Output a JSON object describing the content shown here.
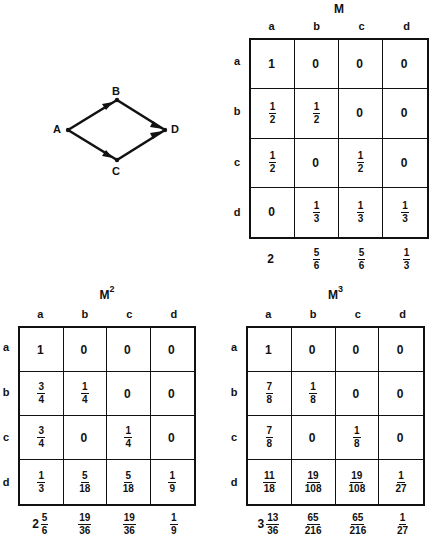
{
  "graph": {
    "nodes": [
      {
        "id": "A",
        "label": "A"
      },
      {
        "id": "B",
        "label": "B"
      },
      {
        "id": "C",
        "label": "C"
      },
      {
        "id": "D",
        "label": "D"
      }
    ],
    "edges": [
      {
        "from": "A",
        "to": "B"
      },
      {
        "from": "A",
        "to": "C"
      },
      {
        "from": "B",
        "to": "D"
      },
      {
        "from": "C",
        "to": "D"
      }
    ]
  },
  "matrices": {
    "M": {
      "title": "M",
      "power": "",
      "col_headers": [
        "a",
        "b",
        "c",
        "d"
      ],
      "row_headers": [
        "a",
        "b",
        "c",
        "d"
      ],
      "rows": [
        [
          "1",
          "0",
          "0",
          "0"
        ],
        [
          "1/2",
          "1/2",
          "0",
          "0"
        ],
        [
          "1/2",
          "0",
          "1/2",
          "0"
        ],
        [
          "0",
          "1/3",
          "1/3",
          "1/3"
        ]
      ],
      "column_sums": [
        "2",
        "5/6",
        "5/6",
        "1/3"
      ]
    },
    "M2": {
      "title": "M",
      "power": "2",
      "col_headers": [
        "a",
        "b",
        "c",
        "d"
      ],
      "row_headers": [
        "a",
        "b",
        "c",
        "d"
      ],
      "rows": [
        [
          "1",
          "0",
          "0",
          "0"
        ],
        [
          "3/4",
          "1/4",
          "0",
          "0"
        ],
        [
          "3/4",
          "0",
          "1/4",
          "0"
        ],
        [
          "1/3",
          "5/18",
          "5/18",
          "1/9"
        ]
      ],
      "column_sums": [
        "2 5/6",
        "19/36",
        "19/36",
        "1/9"
      ]
    },
    "M3": {
      "title": "M",
      "power": "3",
      "col_headers": [
        "a",
        "b",
        "c",
        "d"
      ],
      "row_headers": [
        "a",
        "b",
        "c",
        "d"
      ],
      "rows": [
        [
          "1",
          "0",
          "0",
          "0"
        ],
        [
          "7/8",
          "1/8",
          "0",
          "0"
        ],
        [
          "7/8",
          "0",
          "1/8",
          "0"
        ],
        [
          "11/18",
          "19/108",
          "19/108",
          "1/27"
        ]
      ],
      "column_sums": [
        "3 13/36",
        "65/216",
        "65/216",
        "1/27"
      ]
    }
  },
  "colors": {
    "ink": "#111111",
    "paper": "#ffffff"
  }
}
